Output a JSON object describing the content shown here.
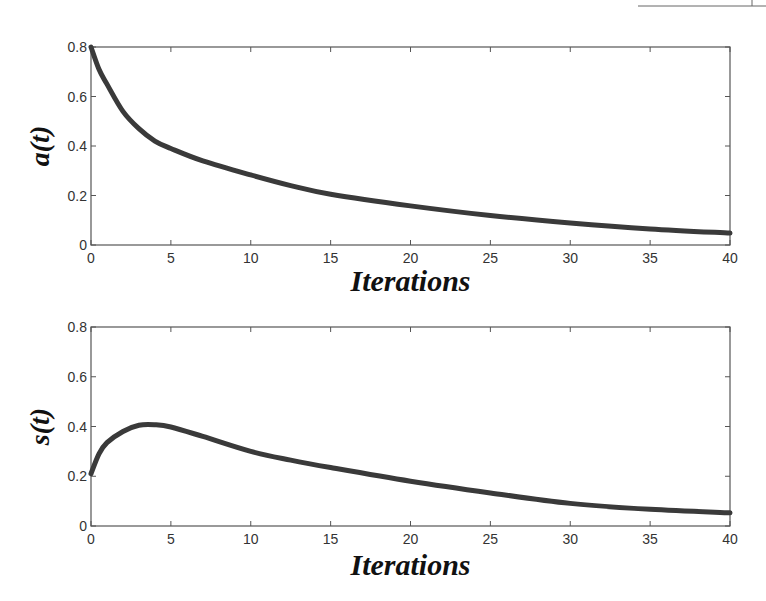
{
  "chart_data": [
    {
      "type": "line",
      "title": "",
      "xlabel": "Iterations",
      "ylabel": "a(t)",
      "xlim": [
        0,
        40
      ],
      "ylim": [
        0,
        0.8
      ],
      "xticks": [
        0,
        5,
        10,
        15,
        20,
        25,
        30,
        35,
        40
      ],
      "yticks": [
        0,
        0.2,
        0.4,
        0.6,
        0.8
      ],
      "ytick_labels": [
        "0",
        "0.2",
        "0.4",
        "0.6",
        "0.8"
      ],
      "grid": false,
      "legend": null,
      "series": [
        {
          "name": "a(t)",
          "color": "#3a3a3a",
          "x": [
            0,
            0.5,
            1,
            2,
            3,
            4,
            5,
            7,
            10,
            12.5,
            15,
            20,
            25,
            30,
            35,
            40
          ],
          "values": [
            0.8,
            0.71,
            0.65,
            0.54,
            0.47,
            0.42,
            0.39,
            0.34,
            0.283,
            0.24,
            0.205,
            0.158,
            0.119,
            0.089,
            0.065,
            0.048
          ]
        }
      ]
    },
    {
      "type": "line",
      "title": "",
      "xlabel": "Iterations",
      "ylabel": "s(t)",
      "xlim": [
        0,
        40
      ],
      "ylim": [
        0,
        0.8
      ],
      "xticks": [
        0,
        5,
        10,
        15,
        20,
        25,
        30,
        35,
        40
      ],
      "yticks": [
        0,
        0.2,
        0.4,
        0.6,
        0.8
      ],
      "ytick_labels": [
        "0",
        "0.2",
        "0.4",
        "0.6",
        "0.8"
      ],
      "grid": false,
      "legend": null,
      "series": [
        {
          "name": "s(t)",
          "color": "#3a3a3a",
          "x": [
            0,
            0.5,
            1,
            2,
            3,
            4,
            5,
            7,
            10,
            12.5,
            15,
            20,
            25,
            30,
            35,
            40
          ],
          "values": [
            0.21,
            0.29,
            0.335,
            0.38,
            0.405,
            0.407,
            0.398,
            0.36,
            0.3,
            0.265,
            0.235,
            0.18,
            0.133,
            0.091,
            0.067,
            0.053
          ]
        }
      ]
    }
  ],
  "layout": {
    "panels": [
      {
        "left": 91,
        "top": 47,
        "right": 730,
        "bottom": 245,
        "xlabel_y": 291,
        "ylabel_x": 43
      },
      {
        "left": 91,
        "top": 327,
        "right": 730,
        "bottom": 526,
        "xlabel_y": 575,
        "ylabel_x": 43
      }
    ]
  }
}
